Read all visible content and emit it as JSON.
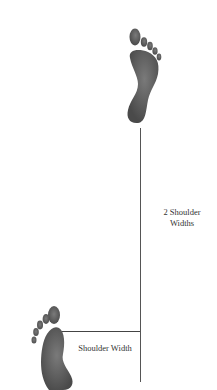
{
  "diagram": {
    "labels": {
      "vertical_distance": "2 Shoulder Widths",
      "horizontal_distance": "Shoulder Width"
    },
    "elements": {
      "top_foot": "right-foot-print",
      "bottom_foot": "left-foot-print"
    },
    "colors": {
      "foot": "#5a5a5a",
      "line": "#555555",
      "text": "#333333",
      "background": "#ffffff"
    }
  }
}
